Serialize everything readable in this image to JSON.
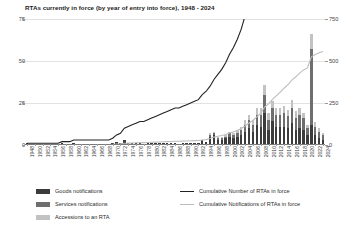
{
  "chart_data": {
    "type": "bar",
    "title": "RTAs currently in force (by year of entry into force), 1948 - 2024",
    "xlabel": "",
    "ylabel": "",
    "ylim": [
      0,
      75
    ],
    "y2lim": [
      0,
      750
    ],
    "grid": true,
    "legend_position": "bottom",
    "yticks": [
      "0",
      "25",
      "50",
      "75"
    ],
    "ytick_values": [
      0,
      25,
      50,
      75
    ],
    "y2ticks": [
      "0",
      "250",
      "500",
      "750"
    ],
    "y2tick_values": [
      0,
      250,
      500,
      750
    ],
    "x": [
      1948,
      1949,
      1950,
      1951,
      1952,
      1953,
      1954,
      1955,
      1956,
      1957,
      1958,
      1959,
      1960,
      1961,
      1962,
      1963,
      1964,
      1965,
      1966,
      1967,
      1968,
      1969,
      1970,
      1971,
      1972,
      1973,
      1974,
      1975,
      1976,
      1977,
      1978,
      1979,
      1980,
      1981,
      1982,
      1983,
      1984,
      1985,
      1986,
      1987,
      1988,
      1989,
      1990,
      1991,
      1992,
      1993,
      1994,
      1995,
      1996,
      1997,
      1998,
      1999,
      2000,
      2001,
      2002,
      2003,
      2004,
      2005,
      2006,
      2007,
      2008,
      2009,
      2010,
      2011,
      2012,
      2013,
      2014,
      2015,
      2016,
      2017,
      2018,
      2019,
      2020,
      2021,
      2022,
      2023,
      2024
    ],
    "xtick_labels": [
      "1948",
      "1950",
      "1952",
      "1954",
      "1956",
      "1958",
      "1960",
      "1962",
      "1964",
      "1966",
      "1968",
      "1970",
      "1972",
      "1974",
      "1976",
      "1978",
      "1980",
      "1982",
      "1984",
      "1986",
      "1988",
      "1990",
      "1992",
      "1994",
      "1996",
      "1998",
      "2000",
      "2002",
      "2004",
      "2006",
      "2008",
      "2010",
      "2012",
      "2014",
      "2016",
      "2018",
      "2020",
      "2022",
      "2024"
    ],
    "stacked": true,
    "series": [
      {
        "name": "Goods notifications",
        "color": "#3b3b3b",
        "values": [
          1,
          0,
          0,
          0,
          0,
          0,
          0,
          0,
          0,
          1,
          0,
          0,
          1,
          0,
          0,
          0,
          0,
          0,
          0,
          0,
          0,
          0,
          1,
          2,
          1,
          3,
          1,
          1,
          1,
          1,
          0,
          1,
          1,
          1,
          1,
          1,
          1,
          1,
          1,
          0,
          1,
          1,
          1,
          1,
          1,
          3,
          2,
          5,
          6,
          3,
          3,
          4,
          5,
          4,
          5,
          6,
          8,
          10,
          8,
          12,
          11,
          19,
          9,
          14,
          11,
          11,
          11,
          10,
          13,
          9,
          10,
          9,
          6,
          12,
          6,
          4,
          3
        ]
      },
      {
        "name": "Services notifications",
        "color": "#6e6e6e",
        "values": [
          0,
          0,
          0,
          0,
          0,
          0,
          0,
          0,
          0,
          0,
          0,
          0,
          0,
          0,
          0,
          0,
          0,
          0,
          0,
          0,
          0,
          0,
          0,
          0,
          0,
          0,
          0,
          0,
          0,
          0,
          0,
          0,
          0,
          0,
          0,
          0,
          0,
          0,
          0,
          0,
          0,
          0,
          0,
          0,
          0,
          0,
          0,
          1,
          1,
          1,
          1,
          1,
          2,
          2,
          2,
          3,
          4,
          5,
          4,
          6,
          7,
          11,
          6,
          8,
          7,
          7,
          8,
          7,
          9,
          7,
          8,
          7,
          4,
          45,
          5,
          4,
          3
        ]
      },
      {
        "name": "Accessions to an RTA",
        "color": "#c2c2c2",
        "values": [
          0,
          0,
          0,
          0,
          0,
          0,
          0,
          0,
          0,
          0,
          0,
          0,
          0,
          0,
          0,
          0,
          0,
          0,
          0,
          0,
          0,
          0,
          0,
          0,
          0,
          0,
          0,
          0,
          0,
          0,
          0,
          0,
          0,
          0,
          0,
          0,
          0,
          0,
          0,
          0,
          0,
          0,
          0,
          0,
          0,
          0,
          0,
          1,
          1,
          1,
          1,
          1,
          1,
          1,
          2,
          2,
          3,
          3,
          3,
          4,
          4,
          6,
          4,
          4,
          4,
          4,
          4,
          4,
          5,
          4,
          4,
          3,
          2,
          9,
          3,
          2,
          1
        ]
      }
    ],
    "lines": [
      {
        "name": "Cumulative Number of RTAs in force",
        "color": "#222222",
        "axis": "left",
        "values": [
          1,
          1,
          1,
          1,
          1,
          1,
          1,
          1,
          1,
          2,
          2,
          2,
          3,
          3,
          3,
          3,
          3,
          3,
          3,
          3,
          3,
          3,
          4,
          6,
          7,
          10,
          11,
          12,
          13,
          14,
          14,
          15,
          16,
          17,
          18,
          19,
          20,
          21,
          22,
          22,
          23,
          24,
          25,
          26,
          27,
          30,
          32,
          35,
          39,
          42,
          45,
          49,
          54,
          58,
          63,
          69,
          77,
          87,
          95,
          107,
          118,
          137,
          146,
          160,
          171,
          182,
          193,
          203,
          216,
          225,
          235,
          244,
          250,
          262,
          268,
          272,
          275
        ]
      },
      {
        "name": "Cumulative Notifications of RTAs in force",
        "color": "#bdbdbd",
        "axis": "right",
        "values": [
          1,
          1,
          1,
          1,
          1,
          1,
          1,
          1,
          1,
          2,
          2,
          2,
          3,
          3,
          3,
          3,
          3,
          3,
          3,
          3,
          3,
          3,
          4,
          6,
          7,
          10,
          11,
          12,
          13,
          14,
          14,
          15,
          16,
          17,
          18,
          19,
          20,
          21,
          22,
          22,
          23,
          24,
          25,
          26,
          27,
          30,
          32,
          39,
          47,
          52,
          57,
          63,
          71,
          78,
          87,
          98,
          113,
          131,
          146,
          168,
          190,
          226,
          245,
          271,
          293,
          315,
          338,
          359,
          386,
          406,
          428,
          447,
          459,
          525,
          539,
          549,
          556
        ]
      }
    ]
  },
  "legend": {
    "bars": [
      {
        "label": "Goods notifications",
        "color": "#3b3b3b"
      },
      {
        "label": "Services notifications",
        "color": "#6e6e6e"
      },
      {
        "label": "Accessions to an RTA",
        "color": "#c2c2c2"
      }
    ],
    "lines": [
      {
        "label": "Cumulative Number of RTAs in force",
        "color": "#222222"
      },
      {
        "label": "Cumulative Notifications of RTAs in force",
        "color": "#bdbdbd"
      }
    ]
  }
}
